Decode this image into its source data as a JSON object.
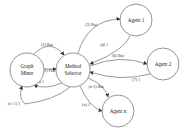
{
  "diagram": {
    "nodes": [
      {
        "id": "graph_miner",
        "lines": [
          "Graph",
          "Miner"
        ],
        "cx": 27,
        "cy": 70,
        "r": 17
      },
      {
        "id": "method_selector",
        "lines": [
          "Method",
          "Selector"
        ],
        "cx": 73,
        "cy": 70,
        "r": 17
      },
      {
        "id": "agent_1",
        "lines": [
          "Agent 1"
        ],
        "cx": 136,
        "cy": 20,
        "r": 16
      },
      {
        "id": "agent_2",
        "lines": [
          "Agent 2"
        ],
        "cx": 163,
        "cy": 64,
        "r": 16
      },
      {
        "id": "agent_n",
        "lines": [
          "Agent n"
        ],
        "cx": 118,
        "cy": 111,
        "r": 16
      }
    ],
    "edges": [
      {
        "id": "e1",
        "label": "(1) Bat",
        "from": "graph_miner",
        "to": "method_selector"
      },
      {
        "id": "e2",
        "label": "(2) Plat",
        "from": "graph_miner",
        "to": "method_selector"
      },
      {
        "id": "e3",
        "label": "(3) 1",
        "from": "method_selector",
        "to": "graph_miner"
      },
      {
        "id": "e4",
        "label": "(3) Bat",
        "from": "method_selector",
        "to": "agent_1"
      },
      {
        "id": "e5",
        "label": "(4) 1",
        "from": "agent_1",
        "to": "method_selector"
      },
      {
        "id": "e6",
        "label": "(6) Bat",
        "from": "method_selector",
        "to": "agent_2"
      },
      {
        "id": "e7",
        "label": "(7) 1",
        "from": "agent_2",
        "to": "method_selector"
      },
      {
        "id": "e8",
        "label": "(n-1) Bat",
        "from": "method_selector",
        "to": "agent_n"
      },
      {
        "id": "e9",
        "label": "(n) 1",
        "from": "agent_n",
        "to": "method_selector"
      },
      {
        "id": "e10",
        "label": "(n+1) 1",
        "from": "method_selector",
        "to": "graph_miner"
      }
    ]
  }
}
